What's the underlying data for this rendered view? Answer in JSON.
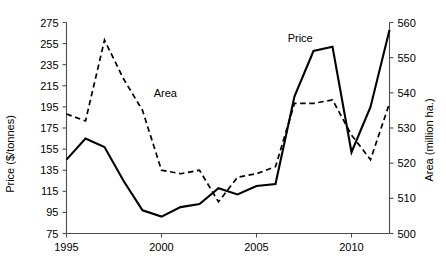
{
  "chart_data": {
    "type": "line",
    "title": "",
    "xlabel": "",
    "ylabel": "Price ($/tonnes)",
    "y2label": "Area (million ha.)",
    "grid": false,
    "legend_position": "inline-annotation",
    "x": [
      1995,
      1996,
      1997,
      1998,
      1999,
      2000,
      2001,
      2002,
      2003,
      2004,
      2005,
      2006,
      2007,
      2008,
      2009,
      2010,
      2011,
      2012
    ],
    "xlim": [
      1995,
      2012
    ],
    "xticks": [
      1995,
      2000,
      2005,
      2010
    ],
    "xticklabels": [
      "1995",
      "2000",
      "2005",
      "2010"
    ],
    "ylim": [
      75,
      275
    ],
    "yticks": [
      75,
      95,
      115,
      135,
      155,
      175,
      195,
      215,
      235,
      255,
      275
    ],
    "yticklabels": [
      "75",
      "95",
      "115",
      "135",
      "155",
      "175",
      "195",
      "215",
      "235",
      "255",
      "275"
    ],
    "y2lim": [
      500,
      560
    ],
    "y2ticks": [
      500,
      510,
      520,
      530,
      540,
      550,
      560
    ],
    "y2ticklabels": [
      "500",
      "510",
      "520",
      "530",
      "540",
      "550",
      "560"
    ],
    "series": [
      {
        "name": "Price",
        "axis": "left",
        "style": "solid",
        "color": "#000000",
        "label_text": "Price",
        "values": [
          145,
          165,
          157,
          125,
          97,
          91,
          100,
          103,
          118,
          112,
          120,
          122,
          205,
          248,
          252,
          152,
          195,
          268
        ]
      },
      {
        "name": "Area",
        "axis": "right",
        "style": "dashed",
        "color": "#000000",
        "label_text": "Area",
        "values": [
          534,
          532,
          555,
          544,
          535,
          518,
          517,
          518,
          509,
          516,
          517,
          519,
          537,
          537,
          538,
          528,
          521,
          537
        ]
      }
    ],
    "annotations": [
      {
        "text": "Area",
        "x": 2000.2,
        "y_px": 97
      },
      {
        "text": "Price",
        "x": 2007.3,
        "y_px": 42
      }
    ]
  }
}
